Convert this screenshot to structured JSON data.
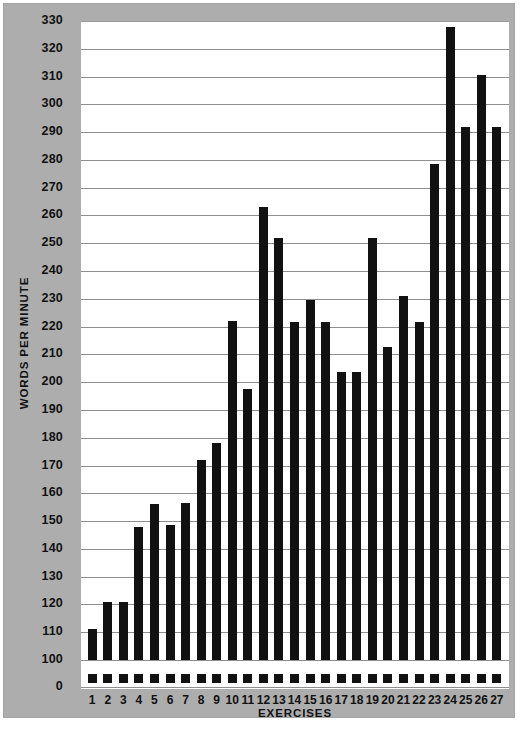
{
  "figure": {
    "panel_color": "#adadad",
    "plot_bg": "#ffffff",
    "bar_color": "#111111",
    "gridline_color": "#8e8e8e"
  },
  "axis": {
    "y_title": "WORDS PER MINUTE",
    "x_title": "EXERCISES",
    "y_ticks": [
      330,
      320,
      310,
      300,
      290,
      280,
      270,
      260,
      250,
      240,
      230,
      220,
      210,
      200,
      190,
      180,
      170,
      160,
      150,
      140,
      130,
      120,
      110,
      100
    ],
    "y_zero_tick": "0",
    "y_break_note": "axis broken between 0 and 100"
  },
  "chart_data": {
    "type": "bar",
    "title": "",
    "xlabel": "EXERCISES",
    "ylabel": "WORDS PER MINUTE",
    "xlim_categories": 27,
    "ylim": [
      100,
      330
    ],
    "y_tick_step": 10,
    "grid": true,
    "legend": "none",
    "axis_break": {
      "from": 0,
      "to": 100
    },
    "categories": [
      "1",
      "2",
      "3",
      "4",
      "5",
      "6",
      "7",
      "8",
      "9",
      "10",
      "11",
      "12",
      "13",
      "14",
      "15",
      "16",
      "17",
      "18",
      "19",
      "20",
      "21",
      "22",
      "23",
      "24",
      "25",
      "26",
      "27"
    ],
    "values": [
      111,
      121,
      121,
      148,
      156,
      148.5,
      156.5,
      172,
      178,
      222,
      197.5,
      263,
      252,
      221.5,
      229.5,
      221.5,
      203.5,
      203.5,
      252,
      212.5,
      231,
      221.5,
      278.5,
      328,
      292,
      310.5,
      292
    ]
  }
}
